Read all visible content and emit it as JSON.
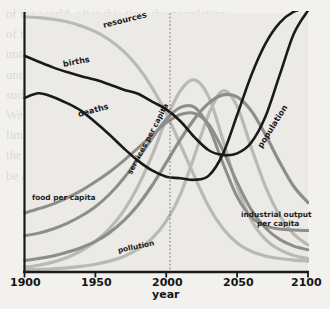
{
  "figure": {
    "background": "#f2f1ee",
    "plot_background": "#eceae6",
    "axis_color": "#1a1a1a"
  },
  "axis": {
    "x_title": "year",
    "x_ticks": [
      "1900",
      "1950",
      "2000",
      "2050",
      "2100"
    ],
    "x_tick_values": [
      1900,
      1950,
      2000,
      2050,
      2100
    ],
    "marker_year": 2000,
    "marker_style": "dotted-vertical"
  },
  "labels": {
    "resources": "resources",
    "births": "births",
    "deaths": "deaths",
    "services_per_capita": "services per capita",
    "population": "population",
    "food_per_capita": "food per capita",
    "industrial_output_per_capita_line1": "industrial output",
    "industrial_output_per_capita_line2": "per capita",
    "pollution": "pollution"
  },
  "chart_data": {
    "type": "line",
    "title": "",
    "subtitle": "",
    "xlabel": "year",
    "ylabel": "",
    "xlim": [
      1900,
      2100
    ],
    "ylim": [
      0,
      1
    ],
    "grid": false,
    "legend": "inline-curve-labels",
    "annotations": [
      {
        "text": "year",
        "role": "x-axis-title"
      },
      {
        "text": "2000",
        "role": "vertical-dotted-reference-line",
        "x": 2000
      }
    ],
    "x": [
      1900,
      1910,
      1920,
      1930,
      1940,
      1950,
      1960,
      1970,
      1980,
      1990,
      2000,
      2010,
      2020,
      2030,
      2040,
      2050,
      2060,
      2070,
      2080,
      2090,
      2100
    ],
    "series": [
      {
        "name": "resources",
        "color": "#b9b9b5",
        "width": 3.2,
        "values": [
          0.985,
          0.982,
          0.976,
          0.966,
          0.95,
          0.928,
          0.896,
          0.852,
          0.792,
          0.712,
          0.612,
          0.492,
          0.368,
          0.252,
          0.168,
          0.112,
          0.08,
          0.062,
          0.052,
          0.046,
          0.042
        ]
      },
      {
        "name": "births",
        "color": "#1a1a1a",
        "width": 2.6,
        "values": [
          0.835,
          0.812,
          0.79,
          0.772,
          0.756,
          0.742,
          0.724,
          0.704,
          0.688,
          0.658,
          0.628,
          0.582,
          0.52,
          0.47,
          0.452,
          0.458,
          0.5,
          0.6,
          0.76,
          0.92,
          1.01
        ]
      },
      {
        "name": "deaths",
        "color": "#1a1a1a",
        "width": 2.6,
        "values": [
          0.672,
          0.69,
          0.676,
          0.652,
          0.622,
          0.578,
          0.53,
          0.478,
          0.43,
          0.392,
          0.368,
          0.362,
          0.356,
          0.372,
          0.456,
          0.606,
          0.76,
          0.882,
          0.962,
          1.005,
          1.02
        ]
      },
      {
        "name": "services per capita",
        "color": "#b9b9b5",
        "width": 3.2,
        "values": [
          0.018,
          0.026,
          0.038,
          0.056,
          0.082,
          0.118,
          0.168,
          0.236,
          0.33,
          0.45,
          0.59,
          0.7,
          0.742,
          0.676,
          0.51,
          0.33,
          0.2,
          0.126,
          0.086,
          0.064,
          0.052
        ]
      },
      {
        "name": "population",
        "color": "#8d8d8a",
        "width": 3.2,
        "values": [
          0.044,
          0.052,
          0.062,
          0.076,
          0.094,
          0.118,
          0.152,
          0.198,
          0.258,
          0.334,
          0.422,
          0.512,
          0.592,
          0.652,
          0.684,
          0.676,
          0.622,
          0.53,
          0.424,
          0.33,
          0.268
        ]
      },
      {
        "name": "food per capita",
        "color": "#8d8d8a",
        "width": 3.0,
        "values": [
          0.228,
          0.244,
          0.262,
          0.286,
          0.314,
          0.348,
          0.386,
          0.43,
          0.478,
          0.528,
          0.576,
          0.608,
          0.612,
          0.57,
          0.47,
          0.346,
          0.24,
          0.17,
          0.126,
          0.1,
          0.086
        ]
      },
      {
        "name": "industrial output per capita",
        "color": "#8d8d8a",
        "width": 3.0,
        "values": [
          0.14,
          0.15,
          0.166,
          0.188,
          0.216,
          0.252,
          0.3,
          0.362,
          0.436,
          0.516,
          0.59,
          0.636,
          0.636,
          0.56,
          0.42,
          0.29,
          0.212,
          0.178,
          0.166,
          0.162,
          0.16
        ]
      },
      {
        "name": "pollution",
        "color": "#b9b9b5",
        "width": 3.2,
        "values": [
          0.008,
          0.01,
          0.012,
          0.016,
          0.022,
          0.03,
          0.042,
          0.06,
          0.088,
          0.13,
          0.196,
          0.3,
          0.45,
          0.61,
          0.7,
          0.64,
          0.48,
          0.33,
          0.218,
          0.146,
          0.104
        ]
      }
    ]
  },
  "bleed_text": "of the world, after this time the population\nof the world, after this time the population\nuntil the world environment had been\nuntil the world environment had been\nsudden collapse in population and\nWe must conclude that the problem of\nlimits of growth the world system is\nthe problem may be reduced by the\nbe able to solve the problem in time"
}
